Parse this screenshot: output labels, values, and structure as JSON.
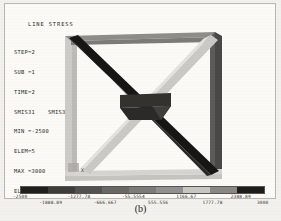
{
  "plot": {
    "title": "LINE STRESS",
    "legend_lines": [
      {
        "label": "STEP=2"
      },
      {
        "label": "SUB =1"
      },
      {
        "label": "TIME=2"
      },
      {
        "label": "SMIS31",
        "label_b": "SMIS31"
      },
      {
        "label": "MIN =-2500"
      },
      {
        "label": "ELEM=5"
      },
      {
        "label": "MAX =3000"
      },
      {
        "label": "ELEM=7"
      }
    ],
    "axis_marker": "X",
    "caption": "(b)"
  },
  "chart_data": {
    "type": "heatmap",
    "title": "LINE STRESS",
    "subtitle": "ANSYS line element stress contour plot of a planar truss",
    "quantity": "SMIS31",
    "load_step": 2,
    "substep": 1,
    "time": 2,
    "min_value": -2500,
    "min_element": 5,
    "max_value": 3000,
    "max_element": 7,
    "contour_bands": 9,
    "band_edges": [
      -2500,
      -1888.89,
      -1277.78,
      -666.667,
      -55.5554,
      555.556,
      1166.67,
      1777.78,
      2388.89,
      3000
    ],
    "band_colors": [
      "#201f1d",
      "#3e3d3a",
      "#545250",
      "#6b6966",
      "#7e7c79",
      "#929090",
      "#c9c7c4",
      "#8a8885",
      "#1d1c1a"
    ],
    "tick_labels_upper": [
      "-2500",
      "-1277.78",
      "-55.5554",
      "1166.67",
      "2388.89"
    ],
    "tick_labels_lower": [
      "-1888.89",
      "-666.667",
      "555.556",
      "1777.78",
      "3000"
    ],
    "xlabel": "",
    "ylabel": "",
    "legend_position": "bottom",
    "grid": false,
    "members": [
      {
        "name": "top-chord",
        "stress_band": "mid-gray",
        "color": "#8f8d8a"
      },
      {
        "name": "left-chord",
        "stress_band": "light-gray",
        "color": "#cdcbc8"
      },
      {
        "name": "right-chord",
        "stress_band": "dark-gray",
        "color": "#4a4846"
      },
      {
        "name": "bottom-chord",
        "stress_band": "light-gray",
        "color": "#c6c4c1"
      },
      {
        "name": "diagonal-tl-br",
        "stress_band": "black-max",
        "color": "#171615"
      },
      {
        "name": "diagonal-bl-tr",
        "stress_band": "white-min",
        "color": "#dedcd9"
      },
      {
        "name": "center-horizontal",
        "stress_band": "dark",
        "color": "#33322f"
      }
    ]
  }
}
